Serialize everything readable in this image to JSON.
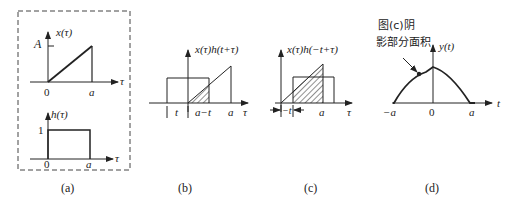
{
  "figure": {
    "panels": [
      {
        "id": "a",
        "caption": "(a)",
        "top_plot": {
          "func_label": "x(τ)",
          "amplitude_label": "A",
          "axis_label": "τ",
          "origin_label": "0",
          "end_label": "a"
        },
        "bottom_plot": {
          "func_label": "h(τ)",
          "amplitude_label": "1",
          "axis_label": "τ",
          "origin_label": "0",
          "end_label": "a"
        }
      },
      {
        "id": "b",
        "caption": "(b)",
        "func_label": "x(τ)h(t+τ)",
        "axis_label": "τ",
        "tick_labels": [
          "t",
          "a−t",
          "a"
        ]
      },
      {
        "id": "c",
        "caption": "(c)",
        "func_label": "x(τ)h(−t+τ)",
        "axis_label": "τ",
        "tick_labels": [
          "−t",
          "a"
        ]
      },
      {
        "id": "d",
        "caption": "(d)",
        "func_label": "y(t)",
        "axis_label": "t",
        "tick_labels": [
          "−a",
          "0",
          "a"
        ],
        "annotation_line1": "图(c)阴",
        "annotation_line2": "影部分面积"
      }
    ]
  }
}
